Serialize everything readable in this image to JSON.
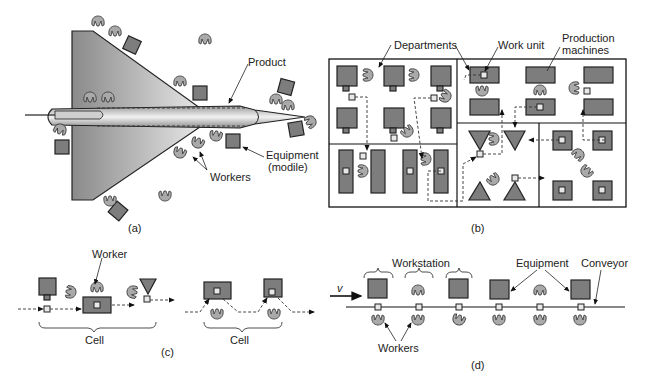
{
  "figure": {
    "panels": [
      {
        "id": "a",
        "caption": "(a)",
        "labels": {
          "product": "Product",
          "equipment": "Equipment",
          "equipment_sub": "(modile)",
          "workers": "Workers"
        }
      },
      {
        "id": "b",
        "caption": "(b)",
        "labels": {
          "departments": "Departments",
          "work_unit": "Work unit",
          "production": "Production",
          "machines": "machines"
        }
      },
      {
        "id": "c",
        "caption": "(c)",
        "labels": {
          "worker": "Worker",
          "cell_1": "Cell",
          "cell_2": "Cell"
        }
      },
      {
        "id": "d",
        "caption": "(d)",
        "labels": {
          "v": "v",
          "workstation": "Workstation",
          "equipment": "Equipment",
          "conveyor": "Conveyor",
          "workers": "Workers"
        }
      }
    ]
  },
  "colors": {
    "machine": "#7d7d7d",
    "worker": "#a9a9a9",
    "product_gradient_dark": "#8c8c8c",
    "product_gradient_light": "#f2f2f2",
    "line": "#222222"
  }
}
